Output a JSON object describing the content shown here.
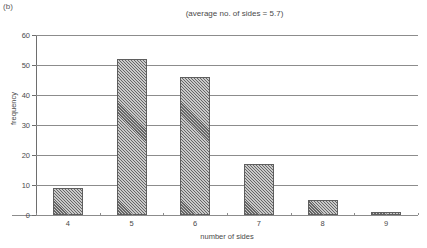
{
  "panel": {
    "label": "(b)"
  },
  "chart_data": {
    "type": "bar",
    "title": "(average no. of sides = 5.7)",
    "xlabel": "number of sides",
    "ylabel": "frequency",
    "categories": [
      "4",
      "5",
      "6",
      "7",
      "8",
      "9"
    ],
    "values": [
      9,
      52,
      46,
      17,
      5,
      1
    ],
    "ylim": [
      0,
      60
    ],
    "yticks": [
      0,
      10,
      20,
      30,
      40,
      50,
      60
    ],
    "ytick_labels": [
      "0",
      "10",
      "20",
      "30",
      "40",
      "50",
      "60"
    ],
    "xlim": [
      3.5,
      9.5
    ],
    "grid": true,
    "grid_axis": "y",
    "legend": null,
    "bar_fill": "#c9c9c9",
    "bar_hatch": "diagonal-crosshatch",
    "bar_edge_color": "#5f5f5f",
    "axis_color": "#8c8c8c",
    "average_no_of_sides": 5.7
  }
}
